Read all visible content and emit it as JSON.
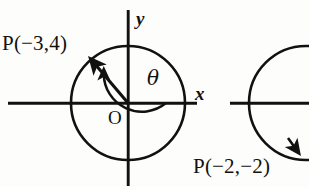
{
  "figure": {
    "type": "geometry-diagram",
    "background_color": "#fdfdfc",
    "ink_color": "#111111"
  },
  "left_diagram": {
    "point_label": "P(−3,4)",
    "origin_label": "O",
    "x_axis_label": "x",
    "y_axis_label": "y",
    "angle_label": "θ",
    "center": {
      "x": 128,
      "y": 103
    },
    "radius": 57,
    "terminal_point": {
      "x": 93,
      "y": 62
    },
    "x_axis": {
      "x1": 8,
      "x2": 197,
      "y": 103
    },
    "y_axis": {
      "x": 128,
      "y1": 10,
      "y2": 186
    },
    "angle_arc": {
      "radius": 38,
      "start_deg": 0,
      "end_deg": 130,
      "direction": "counterclockwise",
      "arrow": "at-terminal-end"
    }
  },
  "right_diagram": {
    "point_label": "P(−2,−2)",
    "center": {
      "x": 306,
      "y": 103
    },
    "radius": 57,
    "terminal_point": {
      "x": 296,
      "y": 150
    },
    "x_axis": {
      "x1": 230,
      "x2": 309,
      "y": 103
    },
    "clipped": true
  },
  "colors": {
    "ink": "#111111",
    "paper": "#fdfdfc"
  }
}
